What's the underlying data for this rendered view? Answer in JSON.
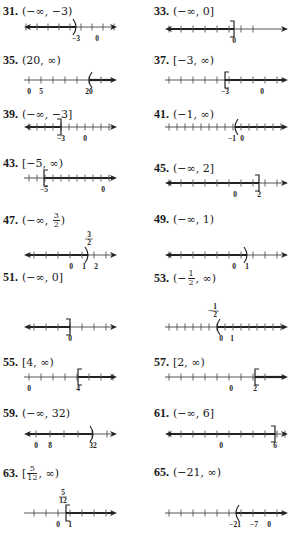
{
  "problems": [
    {
      "id": "31",
      "label": "31.",
      "answer": "(−∞, −3)",
      "x": 0,
      "y": 4,
      "lineY": 23,
      "ticks": [
        26,
        37,
        48,
        59,
        70,
        81,
        92,
        103,
        114
      ],
      "segStart": 24,
      "segEnd": 76,
      "leftArrow": true,
      "rightArrow": false,
      "endpoint": {
        "x": 76,
        "type": "paren-right"
      },
      "labels": [
        {
          "x": 76,
          "text": "−3"
        },
        {
          "x": 97,
          "text": "0"
        }
      ],
      "lineEnd": 117
    },
    {
      "id": "33",
      "label": "33.",
      "answer": "(−∞, 0]",
      "x": 151,
      "y": 4,
      "lineY": 25,
      "ticks": [
        18,
        30,
        42,
        54,
        66,
        78,
        90,
        102
      ],
      "segStart": 14,
      "segEnd": 83,
      "leftArrow": true,
      "rightArrow": false,
      "endpoint": {
        "x": 83,
        "type": "bracket-right"
      },
      "labels": [
        {
          "x": 83,
          "text": "0"
        }
      ],
      "lineEnd": 137
    },
    {
      "id": "35",
      "label": "35.",
      "answer": "(20, ∞)",
      "x": 0,
      "y": 53,
      "lineY": 27,
      "ticks": [
        29,
        41,
        53,
        65,
        77,
        89,
        101
      ],
      "segStart": 89,
      "segEnd": 117,
      "leftArrow": false,
      "rightArrow": true,
      "endpoint": {
        "x": 89,
        "type": "paren-left"
      },
      "labels": [
        {
          "x": 29,
          "text": "0"
        },
        {
          "x": 41,
          "text": "5"
        },
        {
          "x": 89,
          "text": "20"
        }
      ],
      "lineStart": 24,
      "lineEnd": 117
    },
    {
      "id": "37",
      "label": "37.",
      "answer": "[−3, ∞)",
      "x": 151,
      "y": 53,
      "lineY": 27,
      "ticks": [
        18,
        30,
        42,
        54,
        66,
        78,
        90,
        102,
        114,
        126
      ],
      "segStart": 74,
      "segEnd": 137,
      "leftArrow": false,
      "rightArrow": true,
      "endpoint": {
        "x": 74,
        "type": "bracket-left"
      },
      "labels": [
        {
          "x": 74,
          "text": "−3"
        },
        {
          "x": 111,
          "text": "0"
        }
      ],
      "lineStart": 14,
      "lineEnd": 137
    },
    {
      "id": "39",
      "label": "39.",
      "answer": "(−∞, −3]",
      "x": 0,
      "y": 107,
      "lineY": 20,
      "ticks": [
        29,
        37,
        45,
        53,
        61,
        69,
        77,
        85,
        93,
        101,
        109
      ],
      "segStart": 24,
      "segEnd": 61,
      "leftArrow": true,
      "rightArrow": false,
      "endpoint": {
        "x": 61,
        "type": "bracket-right"
      },
      "labels": [
        {
          "x": 61,
          "text": "−3"
        },
        {
          "x": 85,
          "text": "0"
        }
      ],
      "lineEnd": 117
    },
    {
      "id": "41",
      "label": "41.",
      "answer": "(−1, ∞)",
      "x": 151,
      "y": 107,
      "lineY": 20,
      "ticks": [
        18,
        26,
        34,
        42,
        50,
        58,
        66,
        74,
        82,
        90,
        98,
        106,
        114,
        122,
        130
      ],
      "segStart": 84,
      "segEnd": 137,
      "leftArrow": false,
      "rightArrow": true,
      "endpoint": {
        "x": 84,
        "type": "paren-left"
      },
      "labels": [
        {
          "x": 81,
          "text": "−1"
        },
        {
          "x": 91,
          "text": "0"
        }
      ],
      "lineStart": 14,
      "lineEnd": 137
    },
    {
      "id": "43",
      "label": "43.",
      "answer": "[−5, ∞)",
      "x": 0,
      "y": 156,
      "lineY": 22,
      "ticks": [
        29,
        37,
        45,
        53,
        61,
        69,
        77,
        85,
        93,
        101,
        109
      ],
      "segStart": 44,
      "segEnd": 117,
      "leftArrow": false,
      "rightArrow": true,
      "endpoint": {
        "x": 44,
        "type": "bracket-left"
      },
      "labels": [
        {
          "x": 44,
          "text": "−5"
        },
        {
          "x": 103,
          "text": "0"
        }
      ],
      "lineStart": 24,
      "lineEnd": 117
    },
    {
      "id": "45",
      "label": "45.",
      "answer": "(−∞, 2]",
      "x": 151,
      "y": 161,
      "lineY": 22,
      "ticks": [
        18,
        30,
        42,
        54,
        66,
        78,
        90,
        102,
        114,
        126
      ],
      "segStart": 14,
      "segEnd": 108,
      "leftArrow": true,
      "rightArrow": false,
      "endpoint": {
        "x": 108,
        "type": "bracket-right"
      },
      "labels": [
        {
          "x": 84,
          "text": "0"
        },
        {
          "x": 108,
          "text": "2"
        }
      ],
      "lineEnd": 137
    },
    {
      "id": "47",
      "label": "47.",
      "answer_parts": {
        "prefix": "(−∞, ",
        "num": "3",
        "den": "2",
        "suffix": ")"
      },
      "x": 0,
      "y": 212,
      "lineY": 43,
      "ticks": [
        34,
        46,
        58,
        70,
        82,
        94,
        106
      ],
      "segStart": 24,
      "segEnd": 88,
      "leftArrow": true,
      "rightArrow": false,
      "endpoint": {
        "x": 88,
        "type": "paren-right"
      },
      "labels": [
        {
          "x": 71,
          "text": "0"
        },
        {
          "x": 84,
          "text": "1"
        },
        {
          "x": 96,
          "text": "2"
        }
      ],
      "fracLabel": {
        "x": 89,
        "num": "3",
        "den": "2"
      },
      "lineEnd": 117
    },
    {
      "id": "49",
      "label": "49.",
      "answer": "(−∞, 1)",
      "x": 151,
      "y": 212,
      "lineY": 43,
      "ticks": [
        18,
        30,
        42,
        54,
        66,
        78,
        90,
        102,
        114,
        126
      ],
      "segStart": 14,
      "segEnd": 96,
      "leftArrow": true,
      "rightArrow": false,
      "endpoint": {
        "x": 96,
        "type": "paren-right"
      },
      "labels": [
        {
          "x": 83,
          "text": "0"
        },
        {
          "x": 96,
          "text": "1"
        }
      ],
      "lineEnd": 137
    },
    {
      "id": "51",
      "label": "51.",
      "answer": "(−∞, 0]",
      "x": 0,
      "y": 270,
      "lineY": 57,
      "ticks": [
        34,
        46,
        58,
        70,
        82,
        94,
        106
      ],
      "segStart": 24,
      "segEnd": 70,
      "leftArrow": true,
      "rightArrow": false,
      "endpoint": {
        "x": 70,
        "type": "bracket-right"
      },
      "labels": [
        {
          "x": 70,
          "text": "0"
        }
      ],
      "lineEnd": 117
    },
    {
      "id": "53",
      "label": "53.",
      "answer_parts": {
        "prefix": "(−",
        "num": "1",
        "den": "2",
        "suffix": ", ∞)"
      },
      "x": 151,
      "y": 270,
      "lineY": 57,
      "ticks": [
        18,
        26,
        34,
        42,
        50,
        58,
        66,
        74,
        82,
        90,
        98,
        106,
        114,
        122,
        130
      ],
      "segStart": 66,
      "segEnd": 137,
      "leftArrow": false,
      "rightArrow": true,
      "endpoint": {
        "x": 66,
        "type": "paren-left"
      },
      "labels": [
        {
          "x": 70,
          "text": "0"
        },
        {
          "x": 81,
          "text": "1"
        }
      ],
      "fracLabel": {
        "x": 64,
        "num": "1",
        "den": "2",
        "neg": true
      },
      "lineStart": 14,
      "lineEnd": 137
    },
    {
      "id": "55",
      "label": "55.",
      "answer": "[4, ∞)",
      "x": 0,
      "y": 355,
      "lineY": 22,
      "ticks": [
        29,
        41,
        53,
        65,
        77,
        89,
        101,
        113
      ],
      "segStart": 78,
      "segEnd": 117,
      "leftArrow": false,
      "rightArrow": true,
      "endpoint": {
        "x": 78,
        "type": "bracket-left"
      },
      "labels": [
        {
          "x": 29,
          "text": "0"
        },
        {
          "x": 78,
          "text": "4"
        }
      ],
      "lineStart": 24,
      "lineEnd": 117
    },
    {
      "id": "57",
      "label": "57.",
      "answer": "[2, ∞)",
      "x": 151,
      "y": 355,
      "lineY": 22,
      "ticks": [
        18,
        30,
        42,
        54,
        66,
        78,
        90,
        102,
        114
      ],
      "segStart": 104,
      "segEnd": 137,
      "leftArrow": false,
      "rightArrow": true,
      "endpoint": {
        "x": 104,
        "type": "bracket-left"
      },
      "labels": [
        {
          "x": 80,
          "text": "0"
        },
        {
          "x": 104,
          "text": "2"
        }
      ],
      "lineStart": 14,
      "lineEnd": 137
    },
    {
      "id": "59",
      "label": "59.",
      "answer": "(−∞, 32)",
      "x": 0,
      "y": 406,
      "lineY": 28,
      "ticks": [
        36,
        50,
        64,
        78,
        92,
        107
      ],
      "segStart": 24,
      "segEnd": 93,
      "leftArrow": true,
      "rightArrow": false,
      "endpoint": {
        "x": 93,
        "type": "paren-right"
      },
      "labels": [
        {
          "x": 36,
          "text": "0"
        },
        {
          "x": 50,
          "text": "8"
        },
        {
          "x": 93,
          "text": "32"
        }
      ],
      "lineEnd": 117
    },
    {
      "id": "61",
      "label": "61.",
      "answer": "(−∞, 6]",
      "x": 151,
      "y": 406,
      "lineY": 28,
      "ticks": [
        18,
        30,
        42,
        54,
        66,
        78,
        90,
        102,
        114,
        126,
        134
      ],
      "segStart": 14,
      "segEnd": 124,
      "leftArrow": true,
      "rightArrow": false,
      "endpoint": {
        "x": 124,
        "type": "bracket-right"
      },
      "labels": [
        {
          "x": 70,
          "text": "0"
        },
        {
          "x": 124,
          "text": "6"
        }
      ],
      "lineEnd": 137
    },
    {
      "id": "63",
      "label": "63.",
      "answer_parts": {
        "prefix": "[",
        "num": "5",
        "den": "12",
        "suffix": ", ∞)"
      },
      "x": 0,
      "y": 465,
      "lineY": 48,
      "ticks": [
        34,
        46,
        58,
        70,
        82,
        94,
        106
      ],
      "segStart": 66,
      "segEnd": 117,
      "leftArrow": false,
      "rightArrow": true,
      "endpoint": {
        "x": 66,
        "type": "bracket-left"
      },
      "labels": [
        {
          "x": 58,
          "text": "0"
        },
        {
          "x": 70,
          "text": "1"
        }
      ],
      "fracLabel": {
        "x": 63,
        "num": "5",
        "den": "12"
      },
      "lineStart": 24,
      "lineEnd": 117
    },
    {
      "id": "65",
      "label": "65.",
      "answer": "(−21, ∞)",
      "x": 151,
      "y": 465,
      "lineY": 48,
      "ticks": [
        18,
        30,
        42,
        54,
        66,
        78,
        90,
        102,
        114,
        126
      ],
      "segStart": 85,
      "segEnd": 137,
      "leftArrow": false,
      "rightArrow": true,
      "endpoint": {
        "x": 85,
        "type": "paren-left"
      },
      "labels": [
        {
          "x": 84,
          "text": "−21"
        },
        {
          "x": 103,
          "text": "−7"
        },
        {
          "x": 118,
          "text": "0"
        }
      ],
      "lineStart": 14,
      "lineEnd": 137
    }
  ],
  "colors": {
    "ink": "#1a1a1a",
    "line": "#555555",
    "shade": "#222222"
  }
}
